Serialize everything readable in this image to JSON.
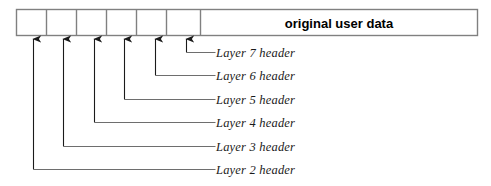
{
  "diagram": {
    "colors": {
      "stroke": "#6e6e6e",
      "box_stroke": "#808080",
      "arrow": "#1a1a1a",
      "text": "#111111",
      "background": "#ffffff"
    },
    "packet_bar": {
      "data_field": {
        "label": "original user data",
        "x": 200,
        "width": 278
      },
      "header_cells": [
        {
          "name": "header-cell-1",
          "x": 16,
          "width": 30
        },
        {
          "name": "header-cell-2",
          "x": 46,
          "width": 30
        },
        {
          "name": "header-cell-3",
          "x": 76,
          "width": 30
        },
        {
          "name": "header-cell-4",
          "x": 106,
          "width": 30
        },
        {
          "name": "header-cell-5",
          "x": 136,
          "width": 30
        },
        {
          "name": "header-cell-6",
          "x": 166,
          "width": 34
        }
      ],
      "top": 9,
      "bottom": 36,
      "left": 16,
      "right": 478
    },
    "callouts": [
      {
        "label": "Layer 7 header",
        "arrow_x": 186,
        "text_y": 53,
        "text_x": 216
      },
      {
        "label": "Layer 6 header",
        "arrow_x": 155,
        "text_y": 76,
        "text_x": 216
      },
      {
        "label": "Layer 5 header",
        "arrow_x": 124,
        "text_y": 100,
        "text_x": 216
      },
      {
        "label": "Layer 4 header",
        "arrow_x": 94,
        "text_y": 123,
        "text_x": 216
      },
      {
        "label": "Layer 3 header",
        "arrow_x": 63,
        "text_y": 147,
        "text_x": 216
      },
      {
        "label": "Layer 2 header",
        "arrow_x": 33,
        "text_y": 170,
        "text_x": 216
      }
    ]
  }
}
